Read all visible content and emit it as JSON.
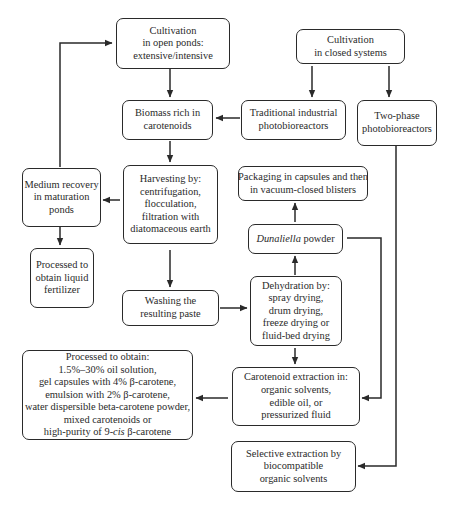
{
  "nodes": {
    "open_ponds": {
      "lines": [
        "Cultivation",
        "in open ponds:",
        "extensive/intensive"
      ]
    },
    "closed_systems": {
      "lines": [
        "Cultivation",
        "in closed systems"
      ]
    },
    "biomass": {
      "lines": [
        "Biomass rich in",
        "carotenoids"
      ]
    },
    "traditional_pbr": {
      "lines": [
        "Traditional industrial",
        "photobioreactors"
      ]
    },
    "two_phase_pbr": {
      "lines": [
        "Two-phase",
        "photobioreactors"
      ]
    },
    "medium_recovery": {
      "lines": [
        "Medium recovery",
        "in maturation",
        "ponds"
      ]
    },
    "harvesting": {
      "lines": [
        "Harvesting by:",
        "centrifugation,",
        "flocculation,",
        "filtration with",
        "diatomaceous earth"
      ]
    },
    "packaging": {
      "lines": [
        "Packaging in capsules and then",
        "in vacuum-closed blisters"
      ]
    },
    "dunaliella_powder": {
      "italic": "Dunaliella",
      "rest": " powder"
    },
    "liquid_fertilizer": {
      "lines": [
        "Processed to",
        "obtain liquid",
        "fertilizer"
      ]
    },
    "washing": {
      "lines": [
        "Washing the",
        "resulting paste"
      ]
    },
    "dehydration": {
      "lines": [
        "Dehydration by:",
        "spray drying,",
        "drum drying,",
        "freeze drying or",
        "fluid-bed drying"
      ]
    },
    "processed_products": {
      "lines": [
        "Processed to obtain:",
        "1.5%–30% oil solution,",
        "gel capsules with 4% β-carotene,",
        "emulsion with 2% β-carotene,",
        "water dispersible beta-carotene powder,",
        "mixed carotenoids or"
      ],
      "last_prefix": "high-purity of 9-",
      "last_italic": "cis",
      "last_suffix": " β-carotene"
    },
    "carotenoid_extraction": {
      "lines": [
        "Carotenoid extraction in:",
        "organic solvents,",
        "edible oil, or",
        "pressurized fluid"
      ]
    },
    "selective_extraction": {
      "lines": [
        "Selective extraction by",
        "biocompatible",
        "organic solvents"
      ]
    }
  },
  "colors": {
    "stroke": "#2a2a2a",
    "background": "#ffffff"
  }
}
